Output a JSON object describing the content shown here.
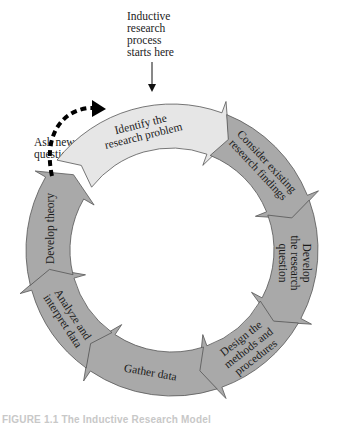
{
  "diagram": {
    "start_note": [
      "Inductive",
      "research",
      "process",
      "starts here"
    ],
    "feedback_note": [
      "Ask new",
      "questions"
    ],
    "caption": "FIGURE 1.1 The Inductive Research Model",
    "colors": {
      "start_step_fill": "#e6e6e6",
      "step_fill": "#a9a9a9",
      "stroke": "#555555",
      "feedback_arrow": "#000000"
    },
    "steps": [
      {
        "id": 1,
        "label_lines": [
          "Identify the",
          "research problem"
        ],
        "highlight": true
      },
      {
        "id": 2,
        "label_lines": [
          "Consider existing",
          "research findings"
        ],
        "highlight": false
      },
      {
        "id": 3,
        "label_lines": [
          "Develop",
          "the research",
          "question"
        ],
        "highlight": false
      },
      {
        "id": 4,
        "label_lines": [
          "Design the",
          "methods and",
          "procedures"
        ],
        "highlight": false
      },
      {
        "id": 5,
        "label_lines": [
          "Gather data"
        ],
        "highlight": false
      },
      {
        "id": 6,
        "label_lines": [
          "Analyze and",
          "interpret data"
        ],
        "highlight": false
      },
      {
        "id": 7,
        "label_lines": [
          "Develop theory"
        ],
        "highlight": false
      }
    ],
    "connections": [
      {
        "from": "start_note",
        "to": 1,
        "style": "solid-arrow"
      },
      {
        "from": 7,
        "to": 1,
        "style": "dashed-arrow",
        "label": "Ask new questions"
      }
    ]
  }
}
